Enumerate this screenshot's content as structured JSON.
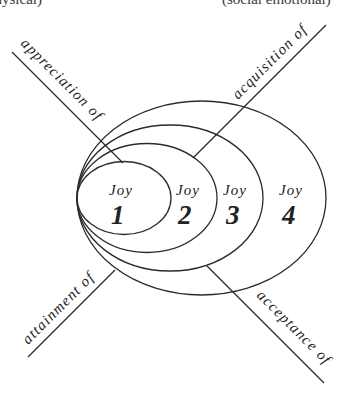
{
  "header": {
    "left_caption": "(physical)",
    "right_caption": "(social emotional)"
  },
  "axes": [
    {
      "id": "upper-left",
      "label": "appreciation of"
    },
    {
      "id": "upper-right",
      "label": "acquisition of"
    },
    {
      "id": "lower-left",
      "label": "attainment of"
    },
    {
      "id": "lower-right",
      "label": "acceptance of"
    }
  ],
  "joys": [
    {
      "word": "Joy",
      "number": "1"
    },
    {
      "word": "Joy",
      "number": "2"
    },
    {
      "word": "Joy",
      "number": "3"
    },
    {
      "word": "Joy",
      "number": "4"
    }
  ],
  "colors": {
    "stroke": "#2b2b2b",
    "text": "#222222",
    "background": "#ffffff"
  }
}
